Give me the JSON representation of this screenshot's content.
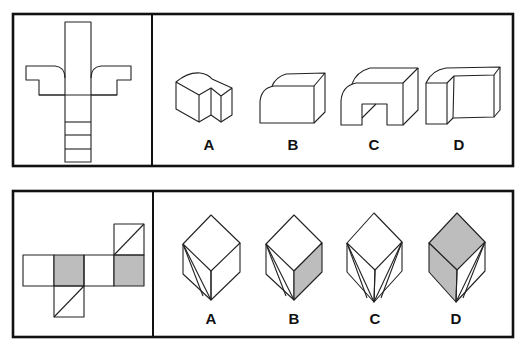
{
  "puzzles": [
    {
      "id": "puzzle-1",
      "prompt_figure": "unfolded-net-with-curved-wings",
      "options": [
        {
          "label": "A"
        },
        {
          "label": "B"
        },
        {
          "label": "C"
        },
        {
          "label": "D"
        }
      ]
    },
    {
      "id": "puzzle-2",
      "prompt_figure": "cube-net-with-gray-and-diagonal-faces",
      "options": [
        {
          "label": "A"
        },
        {
          "label": "B"
        },
        {
          "label": "C"
        },
        {
          "label": "D"
        }
      ]
    }
  ],
  "colors": {
    "line": "#222222",
    "shade": "#bdbdbd",
    "background": "#ffffff"
  }
}
